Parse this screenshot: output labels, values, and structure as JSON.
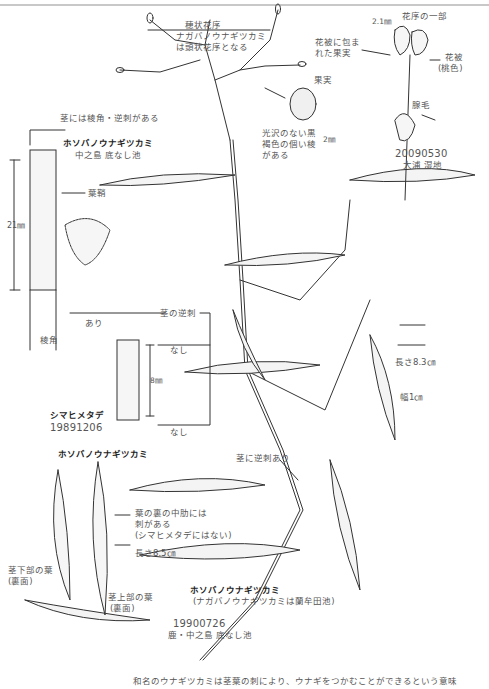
{
  "figure": {
    "species": "ホソバノウナギツカミ",
    "inflorescence": {
      "label": "穂状花序",
      "note_line1": "ナガバノウナギツカミ",
      "note_line2": "は頭状花序となる"
    },
    "flower_detail": {
      "title": "花序の一部",
      "measure": "2.1㎜",
      "fruit_in_perianth_line1": "花被に包ま",
      "fruit_in_perianth_line2": "れた果実",
      "perianth": "花被",
      "perianth_color": "(桃色)",
      "glandular_hair": "腺毛",
      "date": "20090530",
      "location": "大浦 湿地"
    },
    "fruit": {
      "title": "果実",
      "desc_line1": "光沢のない黒",
      "desc_line2": "褐色の個い稜",
      "desc_line3": "がある",
      "measure": "2㎜"
    },
    "stem_detail": {
      "top_note": "茎には稜角・逆刺がある",
      "species": "ホソバノウナギツカミ",
      "location": "中之島 底なし池",
      "sheath": "葉鞘",
      "length": "21㎜",
      "barbs_label": "茎の逆刺",
      "present": "あり",
      "ridge": "稜角"
    },
    "comparison": {
      "species": "シマヒメタデ",
      "date": "19891206",
      "absent_top": "なし",
      "absent_bottom": "なし",
      "length": "8㎜"
    },
    "main_leaf": {
      "length": "長さ8.3㎝",
      "width": "幅1㎝"
    },
    "stem_barbs": "茎に逆刺あり",
    "leaves_detail": {
      "species": "ホソバノウナギツカミ",
      "midrib_line1": "葉の裏の中肋には",
      "midrib_line2": "刺がある",
      "midrib_line3": "(シマヒメタデにはない)",
      "length": "長さ8.5㎝",
      "lower_leaf_line1": "茎下部の葉",
      "lower_leaf_line2": "(裏面)",
      "upper_leaf_line1": "茎上部の葉",
      "upper_leaf_line2": "(裏面)"
    },
    "main_specimen": {
      "species": "ホソバノウナギツカミ",
      "note": "(ナガバノウナギツカミは蘭牟田池)",
      "date": "19900726",
      "location": "鹿・中之島 底なし池"
    },
    "caption": "和名のウナギツカミは茎葉の刺により、ウナギをつかむことができるという意味"
  }
}
